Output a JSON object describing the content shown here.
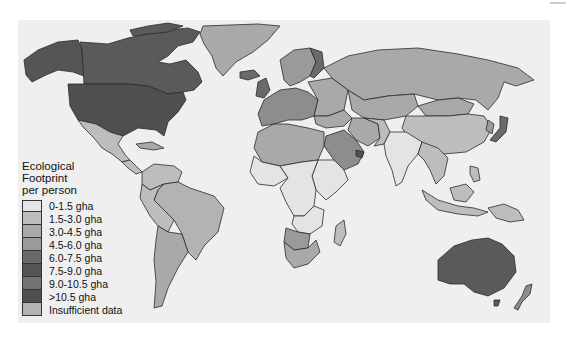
{
  "legend": {
    "title_lines": [
      "Ecological",
      "Footprint",
      "per person"
    ],
    "items": [
      {
        "label": "0-1.5 gha",
        "color": "#e4e4e4"
      },
      {
        "label": "1.5-3.0 gha",
        "color": "#bdbdbd"
      },
      {
        "label": "3.0-4.5 gha",
        "color": "#a9a9a9"
      },
      {
        "label": "4.5-6.0 gha",
        "color": "#9a9a9a"
      },
      {
        "label": "6.0-7.5 gha",
        "color": "#6a6a6a"
      },
      {
        "label": "7.5-9.0 gha",
        "color": "#555555"
      },
      {
        "label": "9.0-10.5 gha",
        "color": "#737373"
      },
      {
        "label": ">10.5 gha",
        "color": "#4f4f4f"
      },
      {
        "label": "Insufficient data",
        "color": "#b3b3b3"
      }
    ]
  },
  "map": {
    "ocean_color": "#efefef",
    "border_color": "#2b2b2b"
  }
}
